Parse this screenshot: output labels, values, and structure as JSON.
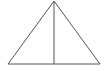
{
  "diagram": {
    "type": "geometry",
    "stroke_color": "#555555",
    "background": "#ffffff",
    "points": {
      "apex": [
        54,
        1
      ],
      "base_left": [
        8,
        64
      ],
      "base_right": [
        100,
        64
      ],
      "base_mid": [
        54,
        64
      ]
    },
    "labels": []
  }
}
